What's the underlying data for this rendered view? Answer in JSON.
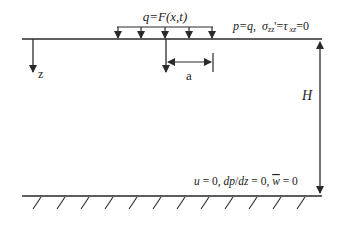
{
  "diagram": {
    "load_label": "q=F(x,t)",
    "top_bc": {
      "prefix": "p=q,",
      "sigma": "σ",
      "sigma_sub": "zz",
      "sigma_prime": "'=",
      "tau": "τ",
      "tau_sub": "xz",
      "suffix": "=0"
    },
    "axis_label": "z",
    "width_label": "a",
    "depth_label": "H",
    "bottom_bc": {
      "u_part": "u",
      "u_eq": " = 0, ",
      "dp_part": "dp",
      "slash": "/",
      "dz_part": "dz",
      "dp_eq": " = 0, ",
      "w_part": "w",
      "w_eq": " = 0"
    },
    "colors": {
      "line": "#2a2a2a",
      "text": "#222222"
    }
  }
}
